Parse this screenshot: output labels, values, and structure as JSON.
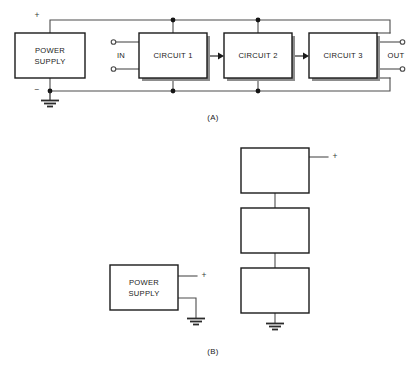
{
  "figure": {
    "panels": [
      {
        "caption": "(A)",
        "caption_pos": {
          "x": 213,
          "y": 118
        },
        "blocks": [
          {
            "name": "power-supply",
            "label_lines": [
              "POWER",
              "SUPPLY"
            ],
            "x": 15,
            "y": 33,
            "w": 70,
            "h": 45,
            "shadow": false
          },
          {
            "name": "circuit-1",
            "label_lines": [
              "CIRCUIT 1"
            ],
            "x": 139,
            "y": 33,
            "w": 68,
            "h": 45,
            "shadow": true
          },
          {
            "name": "circuit-2",
            "label_lines": [
              "CIRCUIT 2"
            ],
            "x": 224,
            "y": 33,
            "w": 68,
            "h": 45,
            "shadow": true
          },
          {
            "name": "circuit-3",
            "label_lines": [
              "CIRCUIT 3"
            ],
            "x": 309,
            "y": 33,
            "w": 68,
            "h": 45,
            "shadow": true
          }
        ],
        "port_labels": [
          {
            "name": "in-label",
            "text": "IN",
            "x": 121,
            "y": 56
          },
          {
            "name": "out-label",
            "text": "OUT",
            "x": 396,
            "y": 56
          }
        ],
        "rail_signs": [
          {
            "name": "positive-rail-sign",
            "text": "+",
            "x": 37,
            "y": 16
          },
          {
            "name": "negative-rail-sign",
            "text": "−",
            "x": 37,
            "y": 90
          }
        ]
      },
      {
        "caption": "(B)",
        "caption_pos": {
          "x": 213,
          "y": 352
        },
        "blocks": [
          {
            "name": "stage-block-top",
            "label_lines": [],
            "x": 241,
            "y": 148,
            "w": 68,
            "h": 45,
            "shadow": false
          },
          {
            "name": "stage-block-middle",
            "label_lines": [],
            "x": 241,
            "y": 208,
            "w": 68,
            "h": 45,
            "shadow": false
          },
          {
            "name": "stage-block-bottom",
            "label_lines": [],
            "x": 241,
            "y": 268,
            "w": 68,
            "h": 45,
            "shadow": false
          },
          {
            "name": "power-supply-b",
            "label_lines": [
              "POWER",
              "SUPPLY"
            ],
            "x": 110,
            "y": 265,
            "w": 68,
            "h": 45,
            "shadow": false
          }
        ],
        "rail_signs": [
          {
            "name": "positive-lead-sign-stack",
            "text": "+",
            "x": 335,
            "y": 157
          },
          {
            "name": "positive-lead-sign-supply",
            "text": "+",
            "x": 204,
            "y": 276
          }
        ]
      }
    ]
  },
  "colors": {
    "line": "#4d4d4d",
    "box_stroke": "#1a1a1a",
    "shadow": "#8d8d8d",
    "text": "#1a1a1a",
    "background": "#ffffff"
  }
}
